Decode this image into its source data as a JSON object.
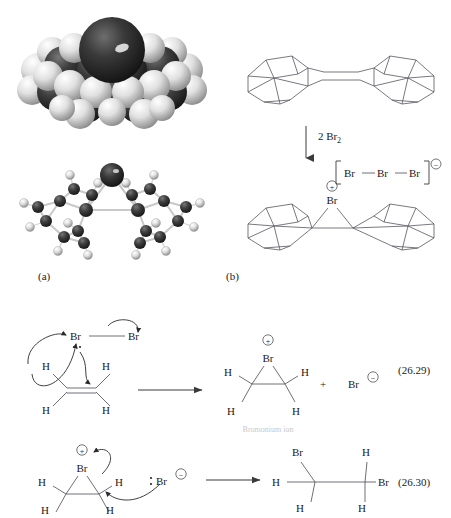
{
  "figure": {
    "panel_a": {
      "label": "(a)",
      "models": [
        {
          "name": "space-filling-model",
          "molecule": "bromonium ion of adamantylideneadamantane"
        },
        {
          "name": "ball-and-stick-model",
          "molecule": "bromonium ion of adamantylideneadamantane"
        }
      ]
    },
    "panel_b": {
      "label": "(b)",
      "reactant": {
        "name": "adamantylideneadamantane"
      },
      "reagent": {
        "text": "2 Br",
        "subscript": "2"
      },
      "product": {
        "bridge_atom": "Br",
        "bridge_charge": "+",
        "counter_ion": {
          "atoms": [
            "Br",
            "Br",
            "Br"
          ],
          "charge": "−"
        }
      }
    }
  },
  "equations": [
    {
      "number": "(26.29)",
      "reactants": {
        "halogen": {
          "atom1": "Br",
          "atom2": "Br"
        },
        "alkene_hydrogens": [
          "H",
          "H",
          "H",
          "H"
        ]
      },
      "products": {
        "bromonium": {
          "atom": "Br",
          "charge": "+",
          "hydrogens": [
            "H",
            "H",
            "H",
            "H"
          ]
        },
        "plus_sign": "+",
        "bromide": {
          "atom": "Br",
          "charge": "−"
        }
      },
      "caption": "Bromonium ion"
    },
    {
      "number": "(26.30)",
      "reactants": {
        "bromonium": {
          "atom": "Br",
          "charge": "+",
          "hydrogens": [
            "H",
            "H",
            "H",
            "H"
          ]
        },
        "nucleophile": {
          "atom": "Br",
          "charge": "−"
        }
      },
      "products": {
        "dibromoethane": {
          "br_top": "Br",
          "br_right": "Br",
          "hydrogens": [
            "H",
            "H",
            "H",
            "H"
          ]
        }
      }
    }
  ],
  "colors": {
    "bromine_sphere": "#2b2b2b",
    "carbon_sphere": "#3a3a3a",
    "hydrogen_sphere": "#efefef",
    "bond_line": "#4a4a55",
    "caption_gray": "#c8c8c8"
  }
}
